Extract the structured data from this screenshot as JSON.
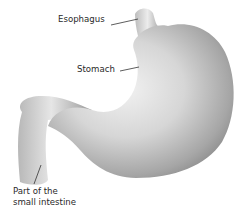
{
  "diagram": {
    "labels": [
      {
        "id": "esophagus",
        "text": "Esophagus"
      },
      {
        "id": "stomach",
        "text": "Stomach"
      },
      {
        "id": "intestine",
        "lines": [
          "Part of the",
          "small intestine"
        ]
      }
    ],
    "colors": {
      "organ_light": "#e9e9e9",
      "organ_mid": "#bdbdbd",
      "organ_dark": "#8a8a8a",
      "leader_line": "#333333",
      "text": "#2a2a2a"
    }
  }
}
